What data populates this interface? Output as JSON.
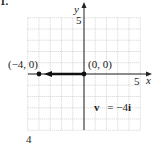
{
  "problem": {
    "number": "1.",
    "footer": "4"
  },
  "chart_data": {
    "type": "scatter",
    "title": "",
    "xlabel": "x",
    "ylabel": "y",
    "xlim": [
      -5,
      5
    ],
    "ylim": [
      -5,
      5
    ],
    "grid": true,
    "x_tick_labels": [
      {
        "value": 5,
        "label": "5"
      }
    ],
    "y_tick_labels": [
      {
        "value": 5,
        "label": "5"
      }
    ],
    "points": [
      {
        "x": -4,
        "y": 0,
        "label": "(−4, 0)"
      },
      {
        "x": 0,
        "y": 0,
        "label": "(0, 0)"
      }
    ],
    "vectors": [
      {
        "from": [
          0,
          0
        ],
        "to": [
          -4,
          0
        ],
        "label": "v = −4i"
      }
    ],
    "annotations": [
      {
        "text": "v",
        "style": "bold"
      },
      {
        "text": "= −4",
        "style": "normal"
      },
      {
        "text": "i",
        "style": "bold"
      }
    ],
    "legend": null
  }
}
